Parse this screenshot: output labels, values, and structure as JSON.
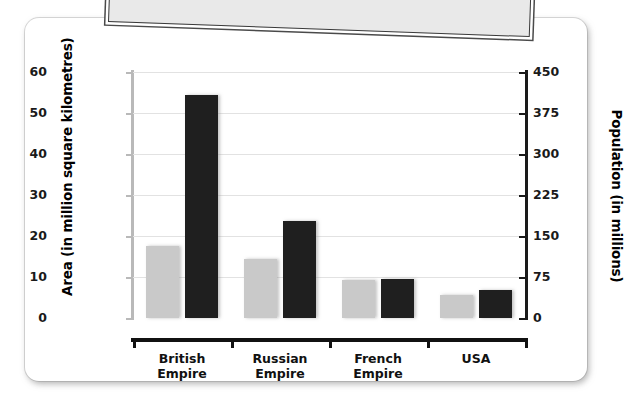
{
  "decor": {
    "banner_label": "tilted-paper-banner"
  },
  "chart_data": {
    "type": "bar",
    "title": "",
    "subtitle": "",
    "xlabel": "",
    "categories": [
      "British Empire",
      "Russian Empire",
      "French Empire",
      "USA"
    ],
    "category_lines": [
      [
        "British",
        "Empire"
      ],
      [
        "Russian",
        "Empire"
      ],
      [
        "French",
        "Empire"
      ],
      [
        "USA",
        ""
      ]
    ],
    "series": [
      {
        "name": "Area (in million square kilometres)",
        "axis": "left",
        "color": "#c9c9c9",
        "values": [
          17.5,
          14.4,
          9.3,
          5.6
        ]
      },
      {
        "name": "Population (in millions)",
        "axis": "right",
        "color": "#1f1f1f",
        "values": [
          408,
          177,
          71,
          51
        ]
      }
    ],
    "left_axis": {
      "label": "Area (in million square kilometres)",
      "ticks": [
        0,
        10,
        20,
        30,
        40,
        50,
        60
      ],
      "tick_labels": [
        "0",
        "10",
        "20",
        "30",
        "40",
        "50",
        "60"
      ],
      "ylim": [
        0,
        60
      ]
    },
    "right_axis": {
      "label": "Population (in millions)",
      "ticks": [
        0,
        75,
        150,
        225,
        300,
        375,
        450
      ],
      "tick_labels": [
        "0",
        "75",
        "150",
        "225",
        "300",
        "375",
        "450"
      ],
      "ylim": [
        0,
        450
      ]
    },
    "grid": true,
    "legend": "none",
    "colors": {
      "area_bar": "#c9c9c9",
      "population_bar": "#1f1f1f",
      "gridline": "#e2e2e2",
      "baseline": "#111111",
      "card_background": "#ffffff",
      "page_background": "#ffffff"
    }
  }
}
